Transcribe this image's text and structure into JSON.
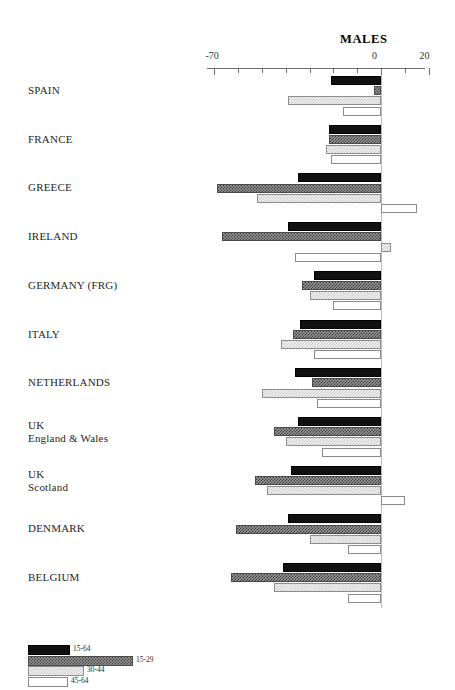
{
  "chart_data": {
    "type": "bar",
    "orientation": "horizontal",
    "title": "MALES",
    "xlabel": "",
    "ylabel": "",
    "xlim": [
      -70,
      20
    ],
    "grid": false,
    "zero_line": true,
    "legend_position": "bottom-left",
    "axis_ticks": [
      -70,
      -60,
      -50,
      -40,
      -30,
      -20,
      -10,
      0,
      10,
      20
    ],
    "axis_tick_labels": [
      "-70",
      "",
      "",
      "",
      "",
      "",
      "",
      "0",
      "",
      "20"
    ],
    "categories": [
      "SPAIN",
      "FRANCE",
      "GREECE",
      "IRELAND",
      "GERMANY (FRG)",
      "ITALY",
      "NETHERLANDS",
      "UK\nEngland & Wales",
      "UK\nScotland",
      "DENMARK",
      "BELGIUM"
    ],
    "series": [
      {
        "name": "15-64",
        "swatch": "solid-black",
        "values": [
          -21,
          -22,
          -35,
          -39,
          -28,
          -34,
          -36,
          -35,
          -38,
          -39,
          -41
        ]
      },
      {
        "name": "15-29",
        "swatch": "dark-checker",
        "values": [
          -3,
          -22,
          -69,
          -67,
          -33,
          -37,
          -29,
          -45,
          -53,
          -61,
          -63
        ]
      },
      {
        "name": "30-44",
        "swatch": "light-checker",
        "values": [
          -39,
          -23,
          -52,
          4,
          -30,
          -42,
          -50,
          -40,
          -48,
          -30,
          -45
        ]
      },
      {
        "name": "45-64",
        "swatch": "white-outline",
        "values": [
          -16,
          -21,
          15,
          -36,
          -20,
          -28,
          -27,
          -25,
          10,
          -14,
          -14
        ]
      }
    ]
  },
  "legend": {
    "items": [
      {
        "label": "15-64",
        "swatch": "solid-black"
      },
      {
        "label": "15-29",
        "swatch": "dark-checker"
      },
      {
        "label": "30-44",
        "swatch": "light-checker"
      },
      {
        "label": "45-64",
        "swatch": "white-outline"
      }
    ]
  }
}
